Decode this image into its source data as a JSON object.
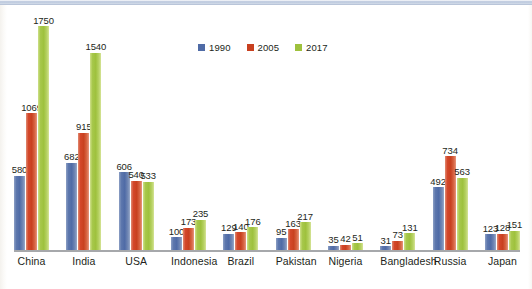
{
  "chart_data": {
    "type": "bar",
    "title": "",
    "subtitle": "",
    "xlabel": "",
    "ylabel": "",
    "grid": false,
    "legend_position": "top-center",
    "ylim": [
      0,
      1750
    ],
    "categories": [
      "China",
      "India",
      "USA",
      "Indonesia",
      "Brazil",
      "Pakistan",
      "Nigeria",
      "Bangladesh",
      "Russia",
      "Japan"
    ],
    "series": [
      {
        "name": "1990",
        "color": "#4f6ba6",
        "values": [
          580,
          682,
          606,
          100,
          129,
          95,
          35,
          31,
          492,
          123
        ]
      },
      {
        "name": "2005",
        "color": "#c8401f",
        "values": [
          1069,
          915,
          540,
          173,
          140,
          163,
          42,
          73,
          734,
          128
        ]
      },
      {
        "name": "2017",
        "color": "#9ec13d",
        "values": [
          1750,
          1540,
          533,
          235,
          176,
          217,
          51,
          131,
          563,
          151
        ]
      }
    ]
  },
  "colors": {
    "series_1990": "#4f6ba6",
    "series_2005": "#c8401f",
    "series_2017": "#9ec13d",
    "axis": "#a6a8ab",
    "text": "#231f20",
    "page_edge": "#b9c6dc"
  }
}
